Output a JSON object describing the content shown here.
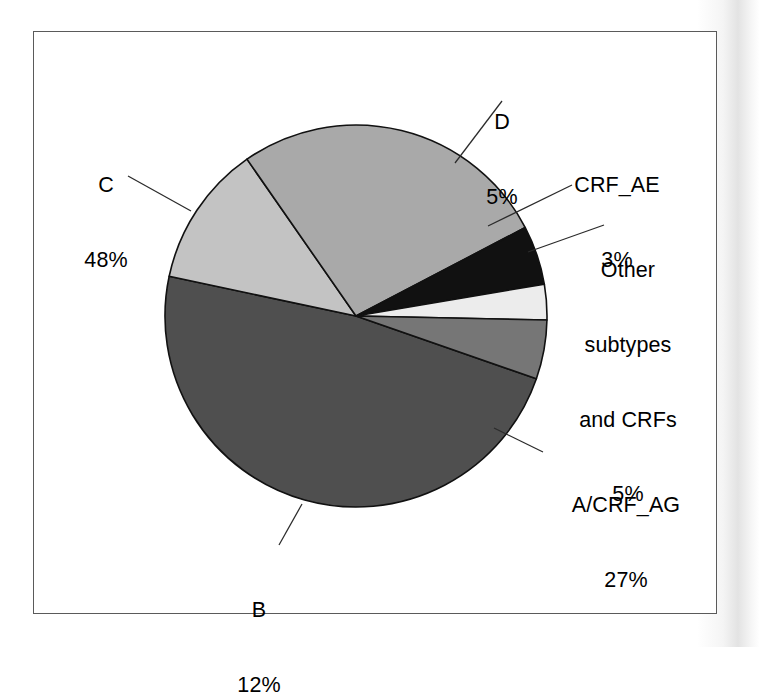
{
  "figure": {
    "frame": {
      "border_color": "#5a5a5a"
    },
    "background_color": "#ffffff"
  },
  "chart_data": {
    "type": "pie",
    "title": "",
    "subtitle": "",
    "xlabel": "",
    "ylabel": "",
    "legend_position": "none",
    "grid": false,
    "labels_show_percent": true,
    "categories": [
      "C",
      "B",
      "A/CRF_AG",
      "Other subtypes and CRFs",
      "CRF_AE",
      "D"
    ],
    "values": [
      48,
      12,
      27,
      5,
      3,
      5
    ],
    "units": "%",
    "total": 100,
    "slices": [
      {
        "name": "C",
        "label": "C",
        "percent": 48,
        "percent_text": "48%",
        "color": "#4f4f4f",
        "start_angle_deg": 168,
        "end_angle_deg": 340.8
      },
      {
        "name": "B",
        "label": "B",
        "percent": 12,
        "percent_text": "12%",
        "color": "#c3c3c3",
        "start_angle_deg": 124.8,
        "end_angle_deg": 168
      },
      {
        "name": "A/CRF_AG",
        "label": "A/CRF_AG",
        "percent": 27,
        "percent_text": "27%",
        "color": "#a9a9a9",
        "start_angle_deg": 27.6,
        "end_angle_deg": 124.8
      },
      {
        "name": "Other subtypes and CRFs",
        "label": "Other\nsubtypes\nand CRFs",
        "label_line1": "Other",
        "label_line2": "subtypes",
        "label_line3": "and CRFs",
        "percent": 5,
        "percent_text": "5%",
        "color": "#111111",
        "start_angle_deg": 9.6,
        "end_angle_deg": 27.6
      },
      {
        "name": "CRF_AE",
        "label": "CRF_AE",
        "percent": 3,
        "percent_text": "3%",
        "color": "#ececec",
        "start_angle_deg": -1.2,
        "end_angle_deg": 9.6
      },
      {
        "name": "D",
        "label": "D",
        "percent": 5,
        "percent_text": "5%",
        "color": "#767676",
        "start_angle_deg": -19.2,
        "end_angle_deg": -1.2
      }
    ]
  },
  "labels": {
    "d": {
      "name": "D",
      "percent_text": "5%"
    },
    "crf_ae": {
      "name": "CRF_AE",
      "percent_text": "3%"
    },
    "other": {
      "line1": "Other",
      "line2": "subtypes",
      "line3": "and CRFs",
      "percent_text": "5%"
    },
    "a_crf_ag": {
      "name": "A/CRF_AG",
      "percent_text": "27%"
    },
    "b": {
      "name": "B",
      "percent_text": "12%"
    },
    "c": {
      "name": "C",
      "percent_text": "48%"
    }
  }
}
